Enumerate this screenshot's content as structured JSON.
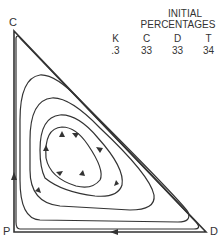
{
  "vertices": {
    "top": "C",
    "bottom_left": "P",
    "bottom_right": "D"
  },
  "header": {
    "line1": "INITIAL",
    "line2": "PERCENTAGES"
  },
  "table": {
    "columns": [
      "K",
      "C",
      "D",
      "T"
    ],
    "values": [
      ".3",
      "33",
      "33",
      "34"
    ]
  },
  "colors": {
    "line": "#333333",
    "background": "#ffffff"
  }
}
